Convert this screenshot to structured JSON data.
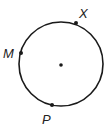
{
  "diagram": {
    "type": "circle-with-points",
    "circle": {
      "cx": 61,
      "cy": 64,
      "r": 42,
      "stroke": "#1a1a1a"
    },
    "center": {
      "x": 61,
      "y": 65
    },
    "points": [
      {
        "label": "M",
        "x": 21,
        "y": 53,
        "label_x": 3,
        "label_y": 58
      },
      {
        "label": "X",
        "x": 76,
        "y": 23,
        "label_x": 79,
        "label_y": 18
      },
      {
        "label": "P",
        "x": 52,
        "y": 105,
        "label_x": 42,
        "label_y": 124
      }
    ]
  }
}
